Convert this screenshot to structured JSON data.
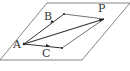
{
  "diagram": {
    "type": "geometry-plane-vectors",
    "plane": {
      "points": [
        [
          47,
          3
        ],
        [
          130,
          3
        ],
        [
          82,
          60
        ],
        [
          0,
          60
        ]
      ]
    },
    "points": {
      "A": {
        "label": "A",
        "x": 24,
        "y": 44,
        "lx": 13,
        "ly": 48
      },
      "B": {
        "label": "B",
        "x": 54,
        "y": 22,
        "lx": 44,
        "ly": 20
      },
      "C": {
        "label": "C",
        "x": 50,
        "y": 46,
        "lx": 42,
        "ly": 57
      },
      "P": {
        "label": "P",
        "x": 104,
        "y": 19,
        "lx": 98,
        "ly": 12
      },
      "D": {
        "label": "",
        "x": 64,
        "y": 14
      },
      "E": {
        "label": "",
        "x": 62,
        "y": 48
      }
    },
    "colors": {
      "line": "#444444",
      "plane": "#666666"
    }
  }
}
